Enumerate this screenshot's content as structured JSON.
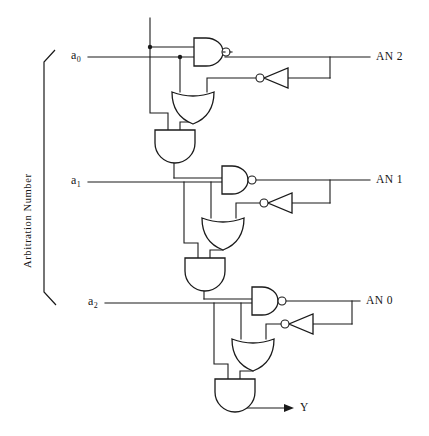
{
  "figure": {
    "title": "",
    "type": "logic-circuit-schematic",
    "group_label": "Arbitration Number",
    "inputs": [
      {
        "id": "a0",
        "text": "a",
        "sub": "0",
        "y": 57
      },
      {
        "id": "a1",
        "text": "a",
        "sub": "1",
        "y": 182
      },
      {
        "id": "a2",
        "text": "a",
        "sub": "2",
        "y": 303
      }
    ],
    "outputs": [
      {
        "id": "an2",
        "label": "AN 2",
        "y": 57
      },
      {
        "id": "an1",
        "label": "AN 1",
        "y": 182
      },
      {
        "id": "an0",
        "label": "AN 0",
        "y": 303
      },
      {
        "id": "y",
        "label": "Y",
        "y": 408
      }
    ],
    "gates": [
      {
        "id": "nand-stage-0",
        "type": "NAND",
        "orientation": "right",
        "stage": 0
      },
      {
        "id": "inverter-stage-0",
        "type": "NOT",
        "orientation": "left",
        "stage": 0
      },
      {
        "id": "or-stage-0",
        "type": "OR",
        "orientation": "down",
        "stage": 0
      },
      {
        "id": "and-stage-0",
        "type": "AND",
        "orientation": "down",
        "stage": 0
      },
      {
        "id": "nand-stage-1",
        "type": "NAND",
        "orientation": "right",
        "stage": 1
      },
      {
        "id": "inverter-stage-1",
        "type": "NOT",
        "orientation": "left",
        "stage": 1
      },
      {
        "id": "or-stage-1",
        "type": "OR",
        "orientation": "down",
        "stage": 1
      },
      {
        "id": "and-stage-1",
        "type": "AND",
        "orientation": "down",
        "stage": 1
      },
      {
        "id": "nand-stage-2",
        "type": "NAND",
        "orientation": "right",
        "stage": 2
      },
      {
        "id": "inverter-stage-2",
        "type": "NOT",
        "orientation": "left",
        "stage": 2
      },
      {
        "id": "or-stage-2",
        "type": "OR",
        "orientation": "down",
        "stage": 2
      },
      {
        "id": "and-stage-2",
        "type": "AND",
        "orientation": "down",
        "stage": 2
      }
    ],
    "colors": {
      "ink": "#1a1a1a",
      "background": "#ffffff"
    }
  }
}
